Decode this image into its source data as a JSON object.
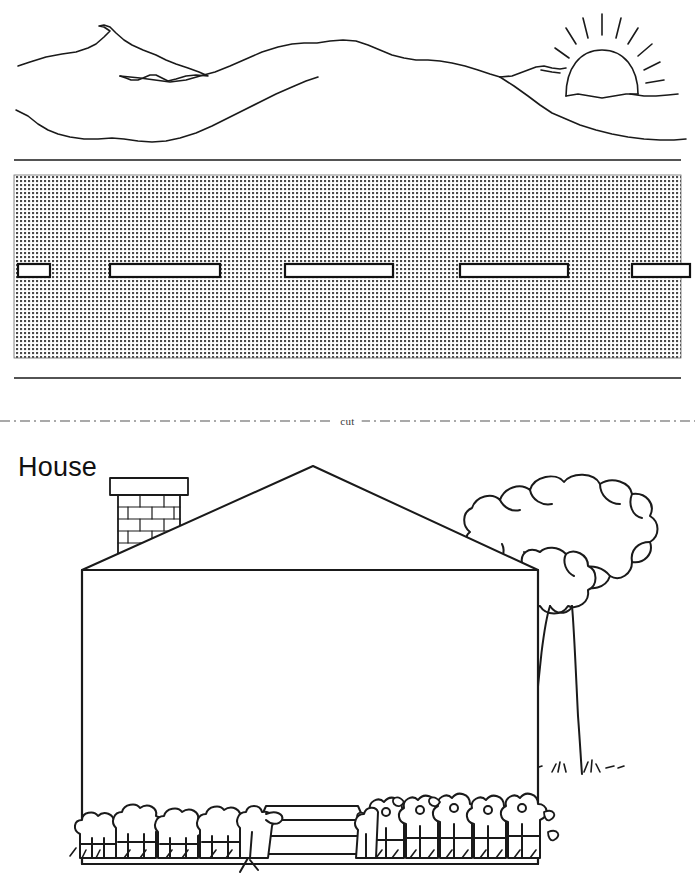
{
  "page": {
    "width": 695,
    "height": 886,
    "background": "#ffffff",
    "ink": "#1a1a1a",
    "texture_color": "#4a4a4a"
  },
  "cut_divider": {
    "label": "cut",
    "style": "dash-dot",
    "y": 420
  },
  "house_panel": {
    "title": "House"
  },
  "scene_top": {
    "name": "mountain-sunrise-landscape",
    "elements": [
      "left-peak",
      "mid-ridge",
      "right-slope",
      "foreground-ridge",
      "rising-sun",
      "sun-rays"
    ],
    "sun": {
      "cx": 602,
      "cy": 73,
      "r": 28,
      "rays": 9
    }
  },
  "wall_band": {
    "name": "textured-wall-strip",
    "top_rule_y": 160,
    "bottom_rule_y": 378,
    "wall_top": 175,
    "wall_bottom": 358,
    "texture": "fine-crosshatch-dots",
    "windows": [
      {
        "x": 20,
        "y": 264,
        "w": 30,
        "h": 12
      },
      {
        "x": 110,
        "y": 264,
        "w": 110,
        "h": 12
      },
      {
        "x": 285,
        "y": 264,
        "w": 108,
        "h": 12
      },
      {
        "x": 460,
        "y": 264,
        "w": 108,
        "h": 12
      },
      {
        "x": 632,
        "y": 264,
        "w": 63,
        "h": 12
      }
    ]
  },
  "house_scene": {
    "name": "house-front-elevation",
    "roof": {
      "apex_x": 313,
      "apex_y": 20,
      "left_x": 82,
      "left_y": 124,
      "right_x": 538,
      "right_y": 124
    },
    "body": {
      "x": 82,
      "y": 124,
      "w": 456,
      "h": 290
    },
    "chimney": {
      "x": 113,
      "y": 32,
      "w": 72,
      "h": 90,
      "cap_h": 14,
      "brick_courses": 6,
      "pattern": "running-bond"
    },
    "tree": {
      "canopy_cx": 592,
      "canopy_cy": 106,
      "trunk_x": 577,
      "trunk_top": 190,
      "trunk_bottom": 320,
      "grass_tufts": 3
    },
    "steps": {
      "x": 253,
      "y": 360,
      "w": 118,
      "treads": 3
    },
    "shrub_row": {
      "left_group_x": 78,
      "left_group_w": 175,
      "right_group_x": 368,
      "right_group_w": 174,
      "left_bushes": 4,
      "right_flowers": 5
    }
  }
}
